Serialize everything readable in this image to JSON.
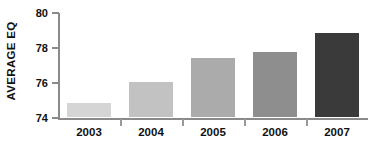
{
  "chart_data": {
    "type": "bar",
    "title": "",
    "xlabel": "",
    "ylabel": "AVERAGE EQ",
    "categories": [
      "2003",
      "2004",
      "2005",
      "2006",
      "2007"
    ],
    "values": [
      74.9,
      76.1,
      77.5,
      77.85,
      78.9
    ],
    "ylim": [
      74,
      80
    ],
    "yticks": [
      74,
      76,
      78,
      80
    ],
    "ytick_labels": [
      "74",
      "76",
      "78",
      "80"
    ],
    "grid": false,
    "legend": null,
    "bar_colors": [
      "#d5d5d5",
      "#c2c2c2",
      "#ababab",
      "#8e8e8e",
      "#3a3a3a"
    ],
    "axis_color": "#8a8a8a",
    "text_color": "#111111",
    "background": "#ffffff"
  }
}
